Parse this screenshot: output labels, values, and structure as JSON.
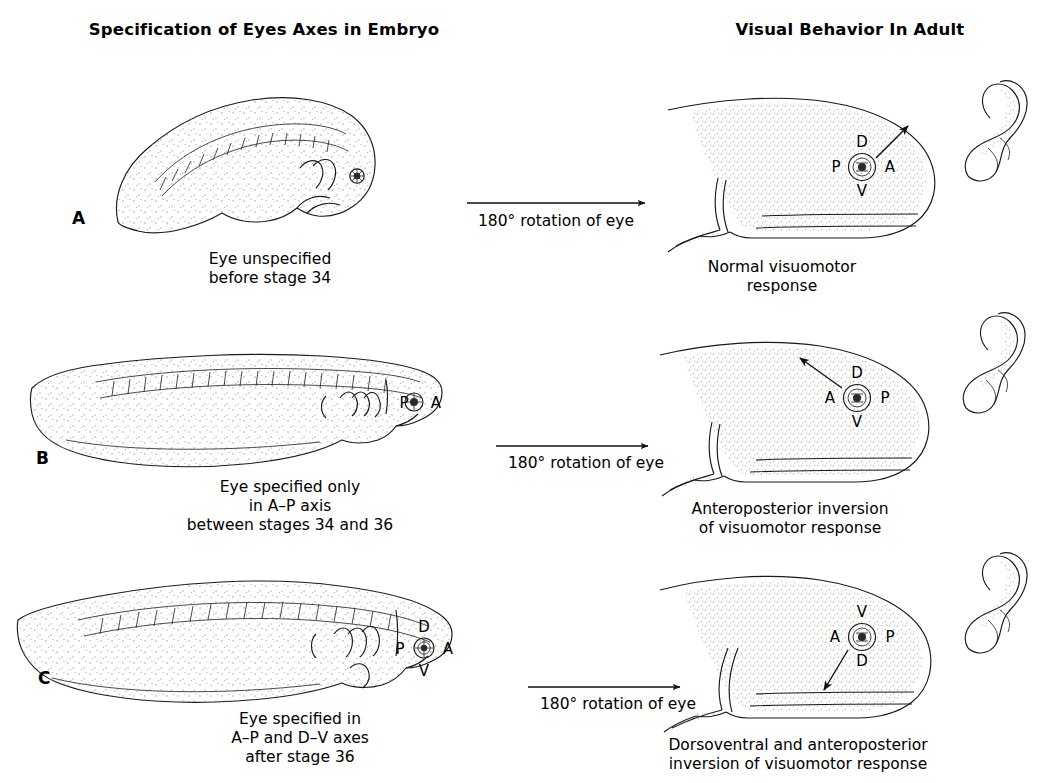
{
  "figure": {
    "background_color": "#ffffff",
    "ink_color": "#1a1a1a",
    "titles": {
      "left": "Specification of Eyes Axes in Embryo",
      "right": "Visual Behavior In Adult"
    }
  },
  "rows": [
    {
      "letter": "A",
      "embryo": {
        "caption": "Eye unspecified\nbefore stage 34",
        "eye_axis_labels": [],
        "eye_specified": false
      },
      "transform": {
        "label": "180° rotation of eye",
        "arrow": "right-arrow-icon"
      },
      "adult": {
        "caption": "Normal visuomotor\nresponse",
        "eye_axis_labels": [
          {
            "letter": "D",
            "position": "top"
          },
          {
            "letter": "P",
            "position": "left"
          },
          {
            "letter": "A",
            "position": "right"
          },
          {
            "letter": "V",
            "position": "bottom"
          }
        ],
        "gaze_direction": "up-right",
        "prey": "worm-icon"
      }
    },
    {
      "letter": "B",
      "embryo": {
        "caption": "Eye specified only\nin A–P axis\nbetween stages 34 and 36",
        "eye_axis_labels": [
          {
            "letter": "P",
            "position": "left"
          },
          {
            "letter": "A",
            "position": "right"
          }
        ],
        "eye_specified": true
      },
      "transform": {
        "label": "180° rotation of eye",
        "arrow": "right-arrow-icon"
      },
      "adult": {
        "caption": "Anteroposterior inversion\nof visuomotor response",
        "eye_axis_labels": [
          {
            "letter": "D",
            "position": "top"
          },
          {
            "letter": "A",
            "position": "left"
          },
          {
            "letter": "P",
            "position": "right"
          },
          {
            "letter": "V",
            "position": "bottom"
          }
        ],
        "gaze_direction": "up-left",
        "prey": "worm-icon"
      }
    },
    {
      "letter": "C",
      "embryo": {
        "caption": "Eye specified in\nA–P and D–V axes\nafter stage 36",
        "eye_axis_labels": [
          {
            "letter": "D",
            "position": "top"
          },
          {
            "letter": "P",
            "position": "left"
          },
          {
            "letter": "A",
            "position": "right"
          },
          {
            "letter": "V",
            "position": "bottom"
          }
        ],
        "eye_specified": true
      },
      "transform": {
        "label": "180° rotation of eye",
        "arrow": "right-arrow-icon"
      },
      "adult": {
        "caption": "Dorsoventral and anteroposterior\ninversion of visuomotor response",
        "eye_axis_labels": [
          {
            "letter": "V",
            "position": "top"
          },
          {
            "letter": "A",
            "position": "left"
          },
          {
            "letter": "P",
            "position": "right"
          },
          {
            "letter": "D",
            "position": "bottom"
          }
        ],
        "gaze_direction": "down-left",
        "prey": "worm-icon"
      }
    }
  ]
}
